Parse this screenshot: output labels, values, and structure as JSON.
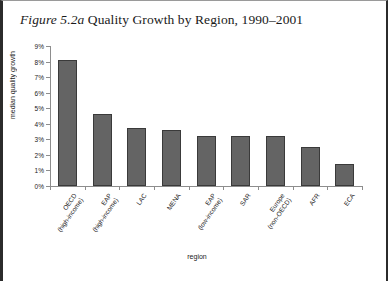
{
  "figure": {
    "title_number": "Figure 5.2a",
    "title_text": " Quality Growth by Region, 1990–2001"
  },
  "chart_data": {
    "type": "bar",
    "title": "Figure 5.2a Quality Growth by Region, 1990–2001",
    "xlabel": "region",
    "ylabel": "median quality growth",
    "ylim": [
      0,
      9
    ],
    "ytick_labels": [
      "0%",
      "1%",
      "2%",
      "3%",
      "4%",
      "5%",
      "6%",
      "7%",
      "8%",
      "9%"
    ],
    "ytick_values": [
      0,
      1,
      2,
      3,
      4,
      5,
      6,
      7,
      8,
      9
    ],
    "grid": false,
    "legend": "none",
    "bar_color": "#646464",
    "bar_edge_color": "#3a3a3a",
    "axis_color": "#8d8d8d",
    "categories": [
      "OECD (high-income)",
      "EAP (high-income)",
      "LAC",
      "MENA",
      "EAP (low-income)",
      "SAR",
      "Europe (non-OECD)",
      "AFR",
      "ECA"
    ],
    "category_lines": [
      [
        "OECD",
        "(high-income)"
      ],
      [
        "EAP",
        "(high-income)"
      ],
      [
        "LAC",
        ""
      ],
      [
        "MENA",
        ""
      ],
      [
        "EAP",
        "(low-income)"
      ],
      [
        "SAR",
        ""
      ],
      [
        "Europe",
        "(non-OECD)"
      ],
      [
        "AFR",
        ""
      ],
      [
        "ECA",
        ""
      ]
    ],
    "values": [
      8.1,
      4.6,
      3.7,
      3.6,
      3.2,
      3.2,
      3.2,
      2.5,
      1.4
    ],
    "units": "percent"
  }
}
